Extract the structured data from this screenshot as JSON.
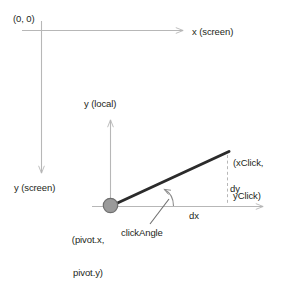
{
  "diagram": {
    "colors": {
      "axis": "#b7b7b7",
      "vector": "#2b2b2b",
      "pivot_fill": "#9a9a9a",
      "pivot_stroke": "#6e6e6e",
      "text": "#231f20",
      "dashed": "#b7b7b7",
      "background": "#ffffff"
    },
    "labels": {
      "origin": "(0, 0)",
      "x_screen": "x (screen)",
      "y_screen": "y (screen)",
      "y_local": "y (local)",
      "click_point_line1": "(xClick,",
      "click_point_line2": "yClick)",
      "dy": "dy",
      "dx": "dx",
      "pivot_line1": "(pivot.x,",
      "pivot_line2": "pivot.y)",
      "click_angle": "clickAngle"
    }
  }
}
